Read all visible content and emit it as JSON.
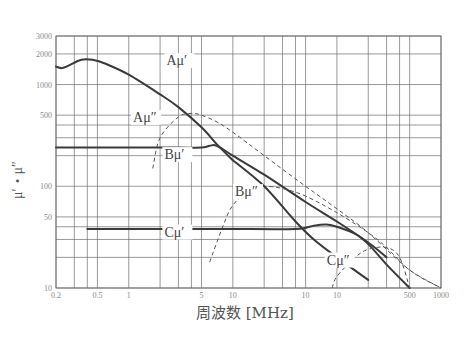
{
  "chart_data": {
    "type": "line",
    "title": "",
    "xlabel": "周波数 [MHz]",
    "ylabel": "μ′・μ″",
    "x_scale": "log",
    "y_scale": "log",
    "xlim": [
      0.2,
      1000
    ],
    "ylim": [
      10,
      3000
    ],
    "grid": true,
    "legend": "inline labels",
    "x_tick_labels": [
      {
        "value": 0.2,
        "label": "0.2"
      },
      {
        "value": 0.5,
        "label": "0.5"
      },
      {
        "value": 1,
        "label": "1"
      },
      {
        "value": 5,
        "label": "5"
      },
      {
        "value": 10,
        "label": "10"
      },
      {
        "value": 50,
        "label": "10"
      },
      {
        "value": 100,
        "label": "10"
      },
      {
        "value": 500,
        "label": "500"
      },
      {
        "value": 1000,
        "label": "1000"
      }
    ],
    "x_gridlines": [
      0.2,
      0.3,
      0.4,
      0.5,
      1,
      2,
      3,
      4,
      5,
      10,
      20,
      30,
      40,
      50,
      100,
      200,
      300,
      400,
      500,
      1000
    ],
    "y_tick_labels": [
      {
        "value": 3000,
        "label": "3000"
      },
      {
        "value": 2000,
        "label": "2000"
      },
      {
        "value": 1000,
        "label": "1000"
      },
      {
        "value": 500,
        "label": "500"
      },
      {
        "value": 100,
        "label": "100"
      },
      {
        "value": 50,
        "label": "50"
      },
      {
        "value": 10,
        "label": "10"
      }
    ],
    "y_gridlines": [
      10,
      20,
      30,
      40,
      50,
      100,
      200,
      300,
      400,
      500,
      1000,
      2000,
      3000
    ],
    "series": [
      {
        "name": "Aμ′",
        "style": "solid",
        "x": [
          0.2,
          0.23,
          0.27,
          0.35,
          0.45,
          0.6,
          1,
          2,
          3,
          5,
          7,
          10
        ],
        "y": [
          1500,
          1450,
          1550,
          1750,
          1750,
          1600,
          1250,
          800,
          600,
          380,
          260,
          180
        ]
      },
      {
        "name": "Aμ″",
        "style": "dashed",
        "x": [
          1.7,
          2,
          3,
          4,
          5,
          7,
          10,
          20,
          50,
          100,
          200,
          500,
          1000
        ],
        "y": [
          150,
          300,
          480,
          520,
          500,
          430,
          340,
          200,
          100,
          60,
          35,
          15,
          10
        ]
      },
      {
        "name": "Bμ′",
        "style": "solid",
        "x": [
          0.2,
          1,
          3,
          5,
          6,
          7,
          10,
          20,
          50,
          100,
          200,
          300
        ],
        "y": [
          240,
          240,
          240,
          240,
          250,
          250,
          200,
          130,
          70,
          45,
          28,
          20
        ]
      },
      {
        "name": "Bμ″",
        "style": "dashed",
        "x": [
          6,
          8,
          10,
          15,
          20,
          30,
          50,
          100,
          200,
          300,
          500,
          1000
        ],
        "y": [
          18,
          40,
          65,
          95,
          100,
          95,
          80,
          55,
          35,
          25,
          15,
          10
        ]
      },
      {
        "name": "Cμ′",
        "style": "solid",
        "x": [
          0.4,
          1,
          5,
          10,
          40,
          60,
          80,
          100,
          150,
          200,
          300,
          500
        ],
        "y": [
          38,
          38,
          38,
          38,
          38,
          41,
          42,
          40,
          34,
          27,
          17,
          10
        ]
      },
      {
        "name": "Cμ″",
        "style": "dashed",
        "x": [
          90,
          100,
          150,
          200,
          300,
          400,
          500
        ],
        "y": [
          10,
          13,
          20,
          24,
          25,
          20,
          10
        ]
      },
      {
        "name": "A/B high-frequency branch",
        "style": "solid",
        "x": [
          10,
          20,
          40,
          60,
          100,
          200
        ],
        "y": [
          180,
          100,
          45,
          30,
          20,
          12
        ]
      }
    ],
    "annotations": [
      {
        "text": "Aμ′",
        "x": 2.3,
        "y": 1550
      },
      {
        "text": "Aμ″",
        "x": 1.1,
        "y": 430
      },
      {
        "text": "Bμ′",
        "x": 2.2,
        "y": 185
      },
      {
        "text": "Bμ″",
        "x": 10.5,
        "y": 80
      },
      {
        "text": "Cμ′",
        "x": 2.2,
        "y": 32
      },
      {
        "text": "Cμ″",
        "x": 80,
        "y": 17
      }
    ]
  }
}
